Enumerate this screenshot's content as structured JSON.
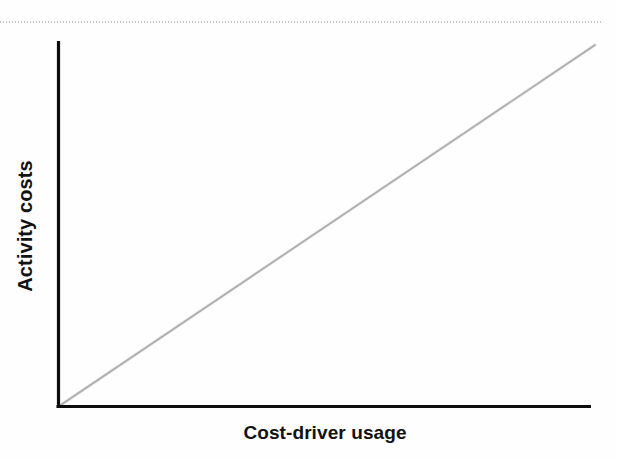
{
  "figure": {
    "background_color": "#fefefe",
    "width": 617,
    "height": 459,
    "scan_artifact_color": "#b9b9bd"
  },
  "axes": {
    "x_title": "Cost-driver usage",
    "y_title": "Activity costs",
    "axis_color": "#0d0d0d",
    "origin_px": [
      58,
      407
    ],
    "x_end_px": [
      590,
      407
    ],
    "y_end_px": [
      58,
      42
    ]
  },
  "series": {
    "line_color": "#9a9a9a",
    "start_px": [
      58,
      407
    ],
    "end_px": [
      595,
      45
    ]
  },
  "chart_data": {
    "type": "line",
    "title": "",
    "subtitle": "",
    "xlabel": "Cost-driver usage",
    "ylabel": "Activity costs",
    "xlim": [
      0,
      100
    ],
    "ylim": [
      0,
      100
    ],
    "x_ticks": [],
    "y_ticks": [],
    "x_tick_labels": [],
    "y_tick_labels": [],
    "grid": false,
    "legend": false,
    "legend_position": "none",
    "annotations": [],
    "series": [
      {
        "name": "Activity costs",
        "color": "#9a9a9a",
        "x": [
          0,
          100
        ],
        "values": [
          0,
          100
        ],
        "description": "Straight proportional line through the origin with constant positive slope"
      }
    ]
  }
}
